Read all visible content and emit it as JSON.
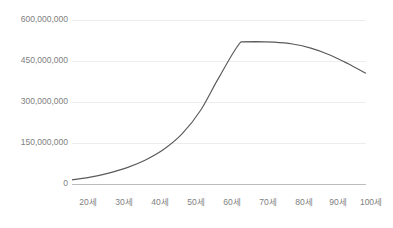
{
  "chart_data": {
    "type": "line",
    "title": "",
    "subtitle": "",
    "xlabel": "",
    "ylabel": "",
    "grid": "horizontal",
    "legend": "none",
    "xlim": [
      20,
      100
    ],
    "ylim": [
      0,
      600000000
    ],
    "categories": [
      "20세",
      "30세",
      "40세",
      "50세",
      "60세",
      "70세",
      "80세",
      "90세",
      "100세"
    ],
    "xtick_labels": [
      "20세",
      "30세",
      "40세",
      "50세",
      "60세",
      "70세",
      "80세",
      "90세",
      "100세"
    ],
    "xtick_values": [
      20,
      30,
      40,
      50,
      60,
      70,
      80,
      90,
      100
    ],
    "ytick_labels": [
      "0",
      "150,000,000",
      "300,000,000",
      "450,000,000",
      "600,000,000"
    ],
    "ytick_values": [
      0,
      150000000,
      300000000,
      450000000,
      600000000
    ],
    "series": [
      {
        "name": "누적금액",
        "color": "#5a5a5a",
        "x": [
          20,
          25,
          30,
          35,
          40,
          45,
          50,
          55,
          60,
          66,
          70,
          75,
          80,
          85,
          90,
          95,
          100
        ],
        "values": [
          15000000,
          25000000,
          40000000,
          60000000,
          88000000,
          127000000,
          184000000,
          270000000,
          390000000,
          520000000,
          521000000,
          519000000,
          512000000,
          497000000,
          473000000,
          441000000,
          405000000
        ]
      }
    ]
  },
  "axis": {
    "ytick_0": "0",
    "ytick_1": "150,000,000",
    "ytick_2": "300,000,000",
    "ytick_3": "450,000,000",
    "ytick_4": "600,000,000",
    "xtick_0": "20세",
    "xtick_1": "30세",
    "xtick_2": "40세",
    "xtick_3": "50세",
    "xtick_4": "60세",
    "xtick_5": "70세",
    "xtick_6": "80세",
    "xtick_7": "90세",
    "xtick_8": "100세"
  },
  "colors": {
    "line": "#5a5a5a",
    "grid": "#ededed",
    "axis": "#bcbcbc",
    "tick_text": "#808080",
    "background": "#ffffff"
  }
}
